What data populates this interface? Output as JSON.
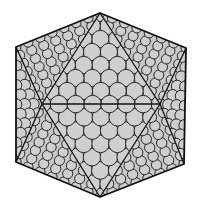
{
  "figure": {
    "kind": "icosahedral-capsid-diagram",
    "width": 200,
    "height": 209,
    "colors": {
      "background": "#ffffff",
      "face_fill": "#c8c8c8",
      "circle_fill": "#cfcfcf",
      "circle_stroke": "#1a1a1a",
      "edge_stroke": "#111111"
    },
    "vertices": {
      "top": [
        100,
        13
      ],
      "upper_left": [
        16,
        47
      ],
      "upper_right": [
        186,
        48
      ],
      "lower_left": [
        16,
        162
      ],
      "lower_right": [
        184,
        164
      ],
      "bottom": [
        100,
        197
      ],
      "mid_left": [
        42,
        104
      ],
      "mid_right": [
        160,
        104
      ]
    },
    "faces": [
      {
        "name": "center-upper",
        "pts": [
          "top",
          "mid_left",
          "mid_right"
        ],
        "subdiv": 7
      },
      {
        "name": "center-lower",
        "pts": [
          "bottom",
          "mid_right",
          "mid_left"
        ],
        "subdiv": 7
      },
      {
        "name": "upper-left",
        "pts": [
          "top",
          "upper_left",
          "mid_left"
        ],
        "subdiv": 7
      },
      {
        "name": "left",
        "pts": [
          "upper_left",
          "lower_left",
          "mid_left"
        ],
        "subdiv": 6
      },
      {
        "name": "lower-left",
        "pts": [
          "lower_left",
          "bottom",
          "mid_left"
        ],
        "subdiv": 7
      },
      {
        "name": "upper-right",
        "pts": [
          "top",
          "upper_right",
          "mid_right"
        ],
        "subdiv": 7
      },
      {
        "name": "right",
        "pts": [
          "upper_right",
          "lower_right",
          "mid_right"
        ],
        "subdiv": 6
      },
      {
        "name": "lower-right",
        "pts": [
          "lower_right",
          "bottom",
          "mid_right"
        ],
        "subdiv": 7
      }
    ],
    "outline": [
      "top",
      "upper_right",
      "lower_right",
      "bottom",
      "lower_left",
      "upper_left"
    ],
    "inner_edges": [
      [
        "top",
        "mid_left"
      ],
      [
        "top",
        "mid_right"
      ],
      [
        "mid_left",
        "mid_right"
      ],
      [
        "mid_left",
        "bottom"
      ],
      [
        "mid_right",
        "bottom"
      ],
      [
        "upper_left",
        "mid_left"
      ],
      [
        "lower_left",
        "mid_left"
      ],
      [
        "upper_right",
        "mid_right"
      ],
      [
        "lower_right",
        "mid_right"
      ]
    ]
  }
}
